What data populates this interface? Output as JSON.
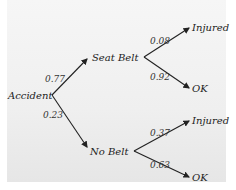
{
  "diagram": {
    "type": "probability-tree",
    "root": {
      "label": "Accident"
    },
    "level1": [
      {
        "label": "Seat Belt",
        "probability": "0.77"
      },
      {
        "label": "No Belt",
        "probability": "0.23"
      }
    ],
    "level2": {
      "seat_belt": [
        {
          "label": "Injured",
          "probability": "0.08"
        },
        {
          "label": "OK",
          "probability": "0.92"
        }
      ],
      "no_belt": [
        {
          "label": "Injured",
          "probability": "0.37"
        },
        {
          "label": "OK",
          "probability": "0.63"
        }
      ]
    }
  },
  "colors": {
    "ink": "#222222",
    "paper": "#f2f2f2"
  }
}
